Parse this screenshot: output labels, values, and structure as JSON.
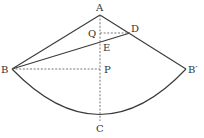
{
  "diagram": {
    "type": "geometry-sector",
    "points": {
      "A": {
        "label": "A",
        "x": 100,
        "y": 15
      },
      "D": {
        "label": "D",
        "x": 130,
        "y": 33
      },
      "Q": {
        "label": "Q",
        "x": 100,
        "y": 33
      },
      "E": {
        "label": "E",
        "x": 100,
        "y": 40
      },
      "B": {
        "label": "B",
        "x": 12,
        "y": 69
      },
      "P": {
        "label": "P",
        "x": 100,
        "y": 69
      },
      "B_prime": {
        "label": "B′",
        "x": 186,
        "y": 69
      },
      "C": {
        "label": "C",
        "x": 100,
        "y": 121
      }
    },
    "solid_segments": [
      "AB",
      "AB′",
      "BD",
      "arc BCB′"
    ],
    "dashed_segments": [
      "AC",
      "QD",
      "BP"
    ]
  },
  "colors": {
    "line": "#3a3a3a",
    "dashed": "#666666",
    "text": "#333333",
    "background": "#ffffff"
  }
}
